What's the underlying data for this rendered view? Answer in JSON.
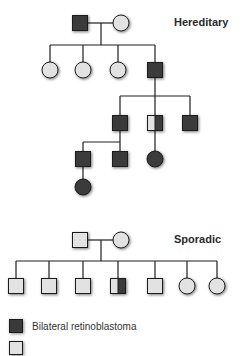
{
  "colors": {
    "affected": "#3a3a3a",
    "unaffected": "#e2e2e2",
    "line": "#1e1e1e"
  },
  "pedigrees": [
    {
      "label": "Hereditary",
      "label_pos": [
        174,
        17
      ],
      "individuals": [
        {
          "id": "h-I-1",
          "sex": "male",
          "status": "affected",
          "cx": 80,
          "cy": 23
        },
        {
          "id": "h-I-2",
          "sex": "female",
          "status": "unaffected",
          "cx": 121,
          "cy": 23
        },
        {
          "id": "h-II-1",
          "sex": "female",
          "status": "unaffected",
          "cx": 50,
          "cy": 70
        },
        {
          "id": "h-II-2",
          "sex": "female",
          "status": "unaffected",
          "cx": 83,
          "cy": 70
        },
        {
          "id": "h-II-3",
          "sex": "female",
          "status": "unaffected",
          "cx": 118,
          "cy": 70
        },
        {
          "id": "h-II-4",
          "sex": "male",
          "status": "affected",
          "cx": 155,
          "cy": 70
        },
        {
          "id": "h-III-1",
          "sex": "male",
          "status": "affected",
          "cx": 120,
          "cy": 123
        },
        {
          "id": "h-III-2",
          "sex": "male",
          "status": "half",
          "cx": 155,
          "cy": 123
        },
        {
          "id": "h-III-3",
          "sex": "male",
          "status": "affected",
          "cx": 190,
          "cy": 123
        },
        {
          "id": "h-IV-1",
          "sex": "male",
          "status": "affected",
          "cx": 83,
          "cy": 159
        },
        {
          "id": "h-IV-2",
          "sex": "male",
          "status": "affected",
          "cx": 120,
          "cy": 159
        },
        {
          "id": "h-IV-3",
          "sex": "female",
          "status": "affected",
          "cx": 155,
          "cy": 159
        },
        {
          "id": "h-V-1",
          "sex": "female",
          "status": "affected",
          "cx": 83,
          "cy": 187
        }
      ],
      "lines": [
        [
          88,
          23,
          113,
          23
        ],
        [
          101,
          23,
          101,
          45
        ],
        [
          50,
          45,
          155,
          45
        ],
        [
          50,
          45,
          50,
          62
        ],
        [
          83,
          45,
          83,
          62
        ],
        [
          118,
          45,
          118,
          62
        ],
        [
          155,
          45,
          155,
          62
        ],
        [
          155,
          78,
          155,
          96
        ],
        [
          120,
          96,
          190,
          96
        ],
        [
          120,
          96,
          120,
          115
        ],
        [
          155,
          96,
          155,
          115
        ],
        [
          190,
          96,
          190,
          115
        ],
        [
          120,
          131,
          120,
          142
        ],
        [
          83,
          142,
          120,
          142
        ],
        [
          83,
          142,
          83,
          151
        ],
        [
          120,
          142,
          120,
          151
        ],
        [
          155,
          131,
          155,
          151
        ],
        [
          83,
          167,
          83,
          179
        ]
      ]
    },
    {
      "label": "Sporadic",
      "label_pos": [
        174,
        234
      ],
      "individuals": [
        {
          "id": "s-I-1",
          "sex": "male",
          "status": "unaffected",
          "cx": 80,
          "cy": 240
        },
        {
          "id": "s-I-2",
          "sex": "female",
          "status": "unaffected",
          "cx": 121,
          "cy": 240
        },
        {
          "id": "s-II-1",
          "sex": "male",
          "status": "unaffected",
          "cx": 16,
          "cy": 286
        },
        {
          "id": "s-II-2",
          "sex": "male",
          "status": "unaffected",
          "cx": 49,
          "cy": 286
        },
        {
          "id": "s-II-3",
          "sex": "male",
          "status": "unaffected",
          "cx": 83,
          "cy": 286
        },
        {
          "id": "s-II-4",
          "sex": "male",
          "status": "half",
          "cx": 118,
          "cy": 286
        },
        {
          "id": "s-II-5",
          "sex": "male",
          "status": "unaffected",
          "cx": 155,
          "cy": 286
        },
        {
          "id": "s-II-6",
          "sex": "female",
          "status": "unaffected",
          "cx": 187,
          "cy": 286
        },
        {
          "id": "s-II-7",
          "sex": "female",
          "status": "unaffected",
          "cx": 217,
          "cy": 286
        }
      ],
      "lines": [
        [
          88,
          240,
          113,
          240
        ],
        [
          101,
          240,
          101,
          261
        ],
        [
          16,
          261,
          217,
          261
        ],
        [
          16,
          261,
          16,
          278
        ],
        [
          49,
          261,
          49,
          278
        ],
        [
          83,
          261,
          83,
          278
        ],
        [
          118,
          261,
          118,
          278
        ],
        [
          155,
          261,
          155,
          278
        ],
        [
          187,
          261,
          187,
          278
        ],
        [
          217,
          261,
          217,
          278
        ]
      ]
    }
  ],
  "legend": [
    {
      "label": "Bilateral retinoblastoma",
      "status": "affected",
      "top": 318
    },
    {
      "label": "",
      "status": "unaffected",
      "top": 340
    }
  ]
}
